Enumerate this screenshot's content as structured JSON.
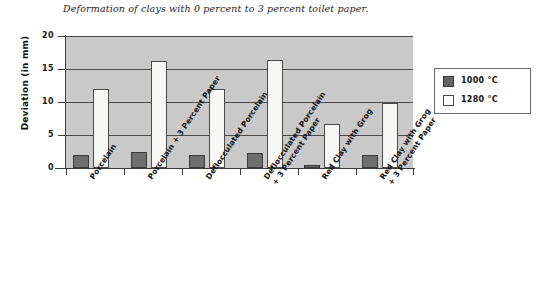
{
  "chart_data": {
    "type": "bar",
    "title": "Deformation of clays with 0 percent to 3 percent toilet paper.",
    "xlabel": "",
    "ylabel": "Deviation (in mm)",
    "ylim": [
      0,
      20
    ],
    "yticks": [
      "0",
      "5",
      "10",
      "15",
      "20"
    ],
    "grid": true,
    "legend_position": "right",
    "categories": [
      "Porcelain",
      "Porcelain + 3 Percent Paper",
      "Deflocculated Porcelain",
      "Deflocculated Porcelain\n+ 3 Percent Paper",
      "Red Clay with Grog",
      "Red Clay with Grog\n+ 3 Percent Paper"
    ],
    "series": [
      {
        "name": "1000 °C",
        "color": "#6e6e6e",
        "values": [
          2.0,
          2.4,
          2.0,
          2.3,
          0.4,
          2.0
        ]
      },
      {
        "name": "1280 °C",
        "color": "#f7f7f5",
        "values": [
          12.0,
          16.2,
          12.0,
          16.3,
          6.6,
          9.9
        ]
      }
    ]
  },
  "legend": {
    "items": [
      {
        "label": "1000 °C",
        "swatch": "dark"
      },
      {
        "label": "1280 °C",
        "swatch": "light"
      }
    ]
  }
}
